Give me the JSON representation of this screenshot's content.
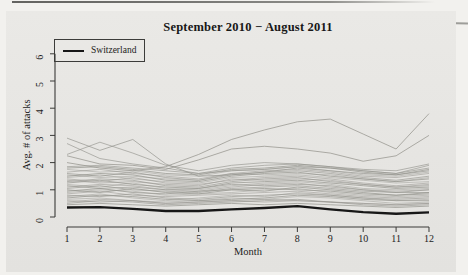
{
  "figure": {
    "legend": {
      "label": "Switzerland",
      "line_color": "#171717"
    },
    "colors": {
      "paper": "#e6e5e2",
      "page_background": "#f2f1ee",
      "gray_line": "#96958f",
      "black_line": "#171717",
      "axis": "#3a3a38",
      "text": "#1c1c1c"
    }
  },
  "chart_data": {
    "type": "line",
    "title": "September 2010 − August 2011",
    "xlabel": "Month",
    "ylabel": "Avg. # of attacks",
    "x_ticks": [
      1,
      2,
      3,
      4,
      5,
      6,
      7,
      8,
      9,
      10,
      11,
      12
    ],
    "y_ticks": [
      0,
      1,
      2,
      3,
      4,
      5,
      6
    ],
    "xlim": [
      1,
      12
    ],
    "ylim": [
      0,
      6.2
    ],
    "grid": false,
    "legend_position": "top-left",
    "series": [
      {
        "name": "unlabeled-country-01",
        "values": [
          2.0,
          1.8,
          1.7,
          1.85,
          2.3,
          2.85,
          3.2,
          3.5,
          3.6,
          3.05,
          2.5,
          3.8
        ],
        "opacity": 0.8
      },
      {
        "name": "unlabeled-country-02",
        "values": [
          2.25,
          1.95,
          1.9,
          1.75,
          2.1,
          2.5,
          2.6,
          2.5,
          2.35,
          2.05,
          2.25,
          3.0
        ],
        "opacity": 0.8
      },
      {
        "name": "unlabeled-country-03",
        "values": [
          2.9,
          2.45,
          2.85,
          1.95,
          1.5,
          1.55,
          1.65,
          1.8,
          1.7,
          1.6,
          1.55,
          1.7
        ],
        "opacity": 0.75
      },
      {
        "name": "unlabeled-country-04",
        "values": [
          2.7,
          2.15,
          1.95,
          1.8,
          1.6,
          1.7,
          1.75,
          1.85,
          1.8,
          1.7,
          1.6,
          1.8
        ],
        "opacity": 0.7
      },
      {
        "name": "unlabeled-country-05",
        "values": [
          2.3,
          2.75,
          2.35,
          1.9,
          1.7,
          1.9,
          2.0,
          1.95,
          1.85,
          1.75,
          1.7,
          1.95
        ],
        "opacity": 0.7
      },
      {
        "name": "unlabeled-country-06",
        "values": [
          0.45,
          0.5,
          0.45,
          0.4,
          0.45,
          0.5,
          0.45,
          0.5,
          0.45,
          0.4,
          0.35,
          0.4
        ]
      },
      {
        "name": "unlabeled-country-07",
        "values": [
          0.5,
          0.6,
          0.55,
          0.45,
          0.5,
          0.55,
          0.6,
          0.65,
          0.55,
          0.45,
          0.4,
          0.45
        ]
      },
      {
        "name": "unlabeled-country-08",
        "values": [
          0.6,
          0.55,
          0.6,
          0.5,
          0.55,
          0.6,
          0.65,
          0.6,
          0.55,
          0.5,
          0.45,
          0.5
        ]
      },
      {
        "name": "unlabeled-country-09",
        "values": [
          0.65,
          0.7,
          0.6,
          0.55,
          0.6,
          0.7,
          0.65,
          0.75,
          0.7,
          0.6,
          0.5,
          0.55
        ]
      },
      {
        "name": "unlabeled-country-10",
        "values": [
          0.7,
          0.8,
          0.75,
          0.65,
          0.6,
          0.65,
          0.7,
          0.8,
          0.75,
          0.65,
          0.6,
          0.6
        ]
      },
      {
        "name": "unlabeled-country-11",
        "values": [
          0.8,
          0.75,
          0.85,
          0.7,
          0.65,
          0.75,
          0.8,
          0.85,
          0.8,
          0.7,
          0.65,
          0.7
        ]
      },
      {
        "name": "unlabeled-country-12",
        "values": [
          0.85,
          0.95,
          0.8,
          0.75,
          0.8,
          0.85,
          0.9,
          0.95,
          0.85,
          0.75,
          0.7,
          0.75
        ]
      },
      {
        "name": "unlabeled-country-13",
        "values": [
          0.9,
          1.0,
          0.95,
          0.8,
          0.85,
          0.9,
          1.0,
          1.05,
          0.9,
          0.8,
          0.75,
          0.8
        ]
      },
      {
        "name": "unlabeled-country-14",
        "values": [
          1.0,
          0.9,
          1.05,
          0.9,
          0.85,
          1.0,
          0.95,
          1.1,
          1.0,
          0.9,
          0.8,
          0.85
        ]
      },
      {
        "name": "unlabeled-country-15",
        "values": [
          1.05,
          1.15,
          1.0,
          0.95,
          0.9,
          1.05,
          1.1,
          1.15,
          1.05,
          0.95,
          0.9,
          0.9
        ]
      },
      {
        "name": "unlabeled-country-16",
        "values": [
          1.1,
          1.2,
          1.15,
          1.0,
          0.95,
          1.1,
          1.2,
          1.25,
          1.1,
          1.0,
          0.95,
          1.0
        ]
      },
      {
        "name": "unlabeled-country-17",
        "values": [
          1.2,
          1.1,
          1.25,
          1.05,
          1.0,
          1.15,
          1.25,
          1.3,
          1.2,
          1.05,
          1.0,
          1.05
        ]
      },
      {
        "name": "unlabeled-country-18",
        "values": [
          1.25,
          1.35,
          1.2,
          1.1,
          1.05,
          1.25,
          1.3,
          1.35,
          1.25,
          1.15,
          1.05,
          1.1
        ]
      },
      {
        "name": "unlabeled-country-19",
        "values": [
          1.3,
          1.4,
          1.35,
          1.15,
          1.1,
          1.3,
          1.4,
          1.45,
          1.3,
          1.2,
          1.1,
          1.15
        ]
      },
      {
        "name": "unlabeled-country-20",
        "values": [
          1.4,
          1.3,
          1.45,
          1.25,
          1.2,
          1.35,
          1.45,
          1.5,
          1.4,
          1.25,
          1.15,
          1.25
        ]
      },
      {
        "name": "unlabeled-country-21",
        "values": [
          1.45,
          1.55,
          1.4,
          1.3,
          1.25,
          1.45,
          1.5,
          1.55,
          1.45,
          1.35,
          1.25,
          1.3
        ]
      },
      {
        "name": "unlabeled-country-22",
        "values": [
          1.5,
          1.6,
          1.55,
          1.35,
          1.3,
          1.5,
          1.6,
          1.65,
          1.5,
          1.4,
          1.3,
          1.4
        ]
      },
      {
        "name": "unlabeled-country-23",
        "values": [
          1.6,
          1.5,
          1.65,
          1.45,
          1.35,
          1.55,
          1.65,
          1.7,
          1.6,
          1.45,
          1.35,
          1.5
        ]
      },
      {
        "name": "unlabeled-country-24",
        "values": [
          1.65,
          1.75,
          1.6,
          1.5,
          1.4,
          1.6,
          1.7,
          1.75,
          1.65,
          1.5,
          1.45,
          1.6
        ]
      },
      {
        "name": "unlabeled-country-25",
        "values": [
          1.75,
          1.65,
          1.7,
          1.55,
          1.5,
          1.7,
          1.75,
          1.85,
          1.7,
          1.55,
          1.5,
          1.65
        ]
      },
      {
        "name": "unlabeled-country-26",
        "values": [
          1.8,
          1.85,
          1.75,
          1.6,
          1.55,
          1.75,
          1.8,
          1.9,
          1.8,
          1.65,
          1.55,
          1.75
        ]
      },
      {
        "name": "unlabeled-country-27",
        "values": [
          1.85,
          1.9,
          1.8,
          1.7,
          1.6,
          1.8,
          1.9,
          1.95,
          1.85,
          1.7,
          1.6,
          1.9
        ]
      },
      {
        "name": "unlabeled-country-28",
        "values": [
          0.55,
          0.65,
          0.6,
          0.5,
          0.55,
          0.6,
          0.55,
          0.6,
          0.55,
          0.5,
          0.45,
          0.5
        ]
      },
      {
        "name": "unlabeled-country-29",
        "values": [
          0.75,
          0.85,
          0.7,
          0.6,
          0.7,
          0.8,
          0.75,
          0.9,
          0.8,
          0.7,
          0.6,
          0.65
        ]
      },
      {
        "name": "unlabeled-country-30",
        "values": [
          0.95,
          1.05,
          0.9,
          0.85,
          0.95,
          1.0,
          1.05,
          1.0,
          0.95,
          0.85,
          0.8,
          0.9
        ]
      },
      {
        "name": "unlabeled-country-31",
        "values": [
          1.15,
          1.05,
          1.1,
          1.0,
          1.05,
          1.2,
          1.15,
          1.2,
          1.15,
          1.0,
          0.9,
          1.0
        ]
      },
      {
        "name": "unlabeled-country-32",
        "values": [
          1.35,
          1.25,
          1.3,
          1.2,
          1.15,
          1.4,
          1.35,
          1.4,
          1.35,
          1.2,
          1.1,
          1.2
        ]
      },
      {
        "name": "unlabeled-country-33",
        "values": [
          1.55,
          1.45,
          1.5,
          1.4,
          1.35,
          1.6,
          1.55,
          1.6,
          1.55,
          1.4,
          1.3,
          1.45
        ]
      },
      {
        "name": "Switzerland",
        "values": [
          0.35,
          0.36,
          0.3,
          0.22,
          0.22,
          0.28,
          0.33,
          0.4,
          0.28,
          0.18,
          0.12,
          0.17
        ],
        "color": "#171717",
        "width": 2.3,
        "opacity": 1
      }
    ]
  }
}
